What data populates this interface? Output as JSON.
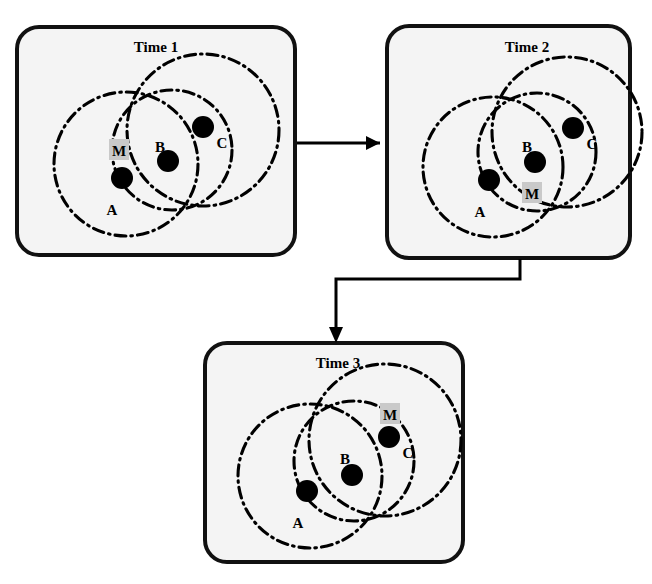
{
  "figure": {
    "background_color": "#ffffff",
    "panel_fill": "#f4f4f4",
    "panel_stroke": "#111111",
    "node_color": "#000000",
    "marker_highlight_color": "#c9c9c9",
    "circle_style": "dash-dot"
  },
  "panels": [
    {
      "id": "time-1",
      "title": "Time 1",
      "title_x": 156,
      "title_y": 52,
      "rect": {
        "x": 17,
        "y": 27,
        "w": 278,
        "h": 228,
        "r": 22
      },
      "circles": [
        {
          "name": "circle-a",
          "cx": 126,
          "cy": 164,
          "r": 72
        },
        {
          "name": "circle-b",
          "cx": 172,
          "cy": 150,
          "r": 60
        },
        {
          "name": "circle-c",
          "cx": 203,
          "cy": 130,
          "r": 76
        }
      ],
      "nodes": [
        {
          "name": "node-a",
          "cx": 122,
          "cy": 178,
          "r": 11,
          "label": "A",
          "label_x": 112,
          "label_y": 215
        },
        {
          "name": "node-b",
          "cx": 168,
          "cy": 161,
          "r": 11,
          "label": "B",
          "label_x": 160,
          "label_y": 152
        },
        {
          "name": "node-c",
          "cx": 203,
          "cy": 127,
          "r": 11,
          "label": "C",
          "label_x": 222,
          "label_y": 148
        }
      ],
      "marker": {
        "name": "marker-m",
        "label": "M",
        "box_x": 109,
        "box_y": 139,
        "box_w": 20,
        "box_h": 21,
        "text_x": 119,
        "text_y": 156
      }
    },
    {
      "id": "time-2",
      "title": "Time 2",
      "title_x": 527,
      "title_y": 52,
      "rect": {
        "x": 387,
        "y": 26,
        "w": 243,
        "h": 232,
        "r": 22
      },
      "circles": [
        {
          "name": "circle-a",
          "cx": 493,
          "cy": 167,
          "r": 70
        },
        {
          "name": "circle-b",
          "cx": 537,
          "cy": 152,
          "r": 59
        },
        {
          "name": "circle-c",
          "cx": 567,
          "cy": 132,
          "r": 75
        }
      ],
      "nodes": [
        {
          "name": "node-a",
          "cx": 489,
          "cy": 180,
          "r": 11,
          "label": "A",
          "label_x": 480,
          "label_y": 217
        },
        {
          "name": "node-b",
          "cx": 535,
          "cy": 162,
          "r": 11,
          "label": "B",
          "label_x": 527,
          "label_y": 152
        },
        {
          "name": "node-c",
          "cx": 573,
          "cy": 128,
          "r": 11,
          "label": "C",
          "label_x": 592,
          "label_y": 149
        }
      ],
      "marker": {
        "name": "marker-m",
        "label": "M",
        "box_x": 522,
        "box_y": 182,
        "box_w": 20,
        "box_h": 21,
        "text_x": 532,
        "text_y": 199
      }
    },
    {
      "id": "time-3",
      "title": "Time 3",
      "title_x": 338,
      "title_y": 368,
      "rect": {
        "x": 205,
        "y": 343,
        "w": 258,
        "h": 219,
        "r": 22
      },
      "circles": [
        {
          "name": "circle-a",
          "cx": 310,
          "cy": 476,
          "r": 72
        },
        {
          "name": "circle-b",
          "cx": 354,
          "cy": 461,
          "r": 60
        },
        {
          "name": "circle-c",
          "cx": 385,
          "cy": 440,
          "r": 76
        }
      ],
      "nodes": [
        {
          "name": "node-a",
          "cx": 307,
          "cy": 491,
          "r": 11,
          "label": "A",
          "label_x": 298,
          "label_y": 528
        },
        {
          "name": "node-b",
          "cx": 352,
          "cy": 475,
          "r": 11,
          "label": "B",
          "label_x": 345,
          "label_y": 464
        },
        {
          "name": "node-c",
          "cx": 389,
          "cy": 437,
          "r": 11,
          "label": "C",
          "label_x": 408,
          "label_y": 458
        }
      ],
      "marker": {
        "name": "marker-m",
        "label": "M",
        "box_x": 380,
        "box_y": 403,
        "box_w": 20,
        "box_h": 21,
        "text_x": 390,
        "text_y": 420
      }
    }
  ],
  "connectors": [
    {
      "name": "arrow-time1-to-time2",
      "from": "time-1",
      "to": "time-2",
      "path": "M 297 143 L 380 143",
      "head": "380,143 366,136 366,150"
    },
    {
      "name": "arrow-time2-to-time3",
      "from": "time-2",
      "to": "time-3",
      "path": "M 520 259 L 520 279 L 336 279 L 336 335",
      "head": "336,343 329,327 343,327"
    }
  ]
}
